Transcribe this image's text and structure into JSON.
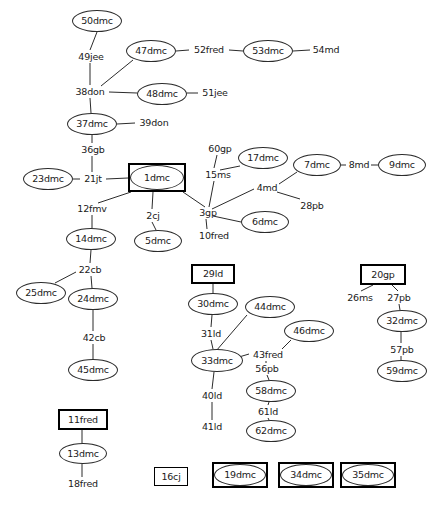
{
  "diagram": {
    "background_color": "#ffffff",
    "line_color": "#2b2b2b",
    "text_color": "#1a1a1a",
    "width": 435,
    "height": 507,
    "nodes": [
      {
        "id": "50dmc",
        "label": "50dmc",
        "shape": "ellipse",
        "x": 72,
        "y": 10,
        "w": 50,
        "h": 22
      },
      {
        "id": "49jee",
        "label": "49jee",
        "shape": "text",
        "x": 74,
        "y": 51,
        "w": 34,
        "h": 12
      },
      {
        "id": "47dmc",
        "label": "47dmc",
        "shape": "ellipse",
        "x": 126,
        "y": 40,
        "w": 50,
        "h": 22
      },
      {
        "id": "52fred",
        "label": "52fred",
        "shape": "text",
        "x": 190,
        "y": 44,
        "w": 38,
        "h": 12
      },
      {
        "id": "53dmc",
        "label": "53dmc",
        "shape": "ellipse",
        "x": 243,
        "y": 40,
        "w": 50,
        "h": 22
      },
      {
        "id": "54md",
        "label": "54md",
        "shape": "text",
        "x": 311,
        "y": 44,
        "w": 30,
        "h": 12
      },
      {
        "id": "38don",
        "label": "38don",
        "shape": "text",
        "x": 72,
        "y": 86,
        "w": 36,
        "h": 12
      },
      {
        "id": "48dmc",
        "label": "48dmc",
        "shape": "ellipse",
        "x": 137,
        "y": 83,
        "w": 50,
        "h": 22
      },
      {
        "id": "51jee",
        "label": "51jee",
        "shape": "text",
        "x": 199,
        "y": 87,
        "w": 32,
        "h": 12
      },
      {
        "id": "37dmc",
        "label": "37dmc",
        "shape": "ellipse",
        "x": 67,
        "y": 113,
        "w": 50,
        "h": 22
      },
      {
        "id": "39don",
        "label": "39don",
        "shape": "text",
        "x": 136,
        "y": 117,
        "w": 36,
        "h": 12
      },
      {
        "id": "36gb",
        "label": "36gb",
        "shape": "text",
        "x": 78,
        "y": 144,
        "w": 30,
        "h": 12
      },
      {
        "id": "23dmc",
        "label": "23dmc",
        "shape": "ellipse",
        "x": 23,
        "y": 168,
        "w": 50,
        "h": 22
      },
      {
        "id": "21jt",
        "label": "21jt",
        "shape": "text",
        "x": 80,
        "y": 173,
        "w": 26,
        "h": 12
      },
      {
        "id": "1dmc",
        "label": "1dmc",
        "shape": "boxed-ellipse",
        "x": 128,
        "y": 163,
        "w": 58,
        "h": 29
      },
      {
        "id": "60gp",
        "label": "60gp",
        "shape": "text",
        "x": 206,
        "y": 143,
        "w": 28,
        "h": 12
      },
      {
        "id": "17dmc",
        "label": "17dmc",
        "shape": "ellipse",
        "x": 238,
        "y": 147,
        "w": 50,
        "h": 22
      },
      {
        "id": "15ms",
        "label": "15ms",
        "shape": "text",
        "x": 204,
        "y": 169,
        "w": 28,
        "h": 12
      },
      {
        "id": "7dmc",
        "label": "7dmc",
        "shape": "ellipse",
        "x": 293,
        "y": 154,
        "w": 48,
        "h": 22
      },
      {
        "id": "8md",
        "label": "8md",
        "shape": "text",
        "x": 347,
        "y": 159,
        "w": 24,
        "h": 12
      },
      {
        "id": "9dmc",
        "label": "9dmc",
        "shape": "ellipse",
        "x": 378,
        "y": 154,
        "w": 48,
        "h": 22
      },
      {
        "id": "4md",
        "label": "4md",
        "shape": "text",
        "x": 255,
        "y": 182,
        "w": 24,
        "h": 12
      },
      {
        "id": "28pb",
        "label": "28pb",
        "shape": "text",
        "x": 298,
        "y": 200,
        "w": 28,
        "h": 12
      },
      {
        "id": "3gp",
        "label": "3gp",
        "shape": "text",
        "x": 197,
        "y": 207,
        "w": 22,
        "h": 12
      },
      {
        "id": "6dmc",
        "label": "6dmc",
        "shape": "ellipse",
        "x": 241,
        "y": 211,
        "w": 48,
        "h": 22
      },
      {
        "id": "10fred",
        "label": "10fred",
        "shape": "text",
        "x": 195,
        "y": 230,
        "w": 38,
        "h": 12
      },
      {
        "id": "2cj",
        "label": "2cj",
        "shape": "text",
        "x": 143,
        "y": 210,
        "w": 20,
        "h": 12
      },
      {
        "id": "5dmc",
        "label": "5dmc",
        "shape": "ellipse",
        "x": 134,
        "y": 230,
        "w": 48,
        "h": 22
      },
      {
        "id": "12fmv",
        "label": "12fmv",
        "shape": "text",
        "x": 75,
        "y": 203,
        "w": 34,
        "h": 12
      },
      {
        "id": "14dmc",
        "label": "14dmc",
        "shape": "ellipse",
        "x": 66,
        "y": 228,
        "w": 50,
        "h": 22
      },
      {
        "id": "22cb",
        "label": "22cb",
        "shape": "text",
        "x": 76,
        "y": 264,
        "w": 28,
        "h": 12
      },
      {
        "id": "25dmc",
        "label": "25dmc",
        "shape": "ellipse",
        "x": 16,
        "y": 282,
        "w": 50,
        "h": 22
      },
      {
        "id": "24dmc",
        "label": "24dmc",
        "shape": "ellipse",
        "x": 68,
        "y": 288,
        "w": 50,
        "h": 22
      },
      {
        "id": "42cb",
        "label": "42cb",
        "shape": "text",
        "x": 80,
        "y": 332,
        "w": 28,
        "h": 12
      },
      {
        "id": "45dmc",
        "label": "45dmc",
        "shape": "ellipse",
        "x": 68,
        "y": 359,
        "w": 50,
        "h": 22
      },
      {
        "id": "29ld",
        "label": "29ld",
        "shape": "rect",
        "x": 191,
        "y": 264,
        "w": 44,
        "h": 20
      },
      {
        "id": "30dmc",
        "label": "30dmc",
        "shape": "ellipse",
        "x": 188,
        "y": 293,
        "w": 50,
        "h": 22
      },
      {
        "id": "31ld",
        "label": "31ld",
        "shape": "text",
        "x": 199,
        "y": 328,
        "w": 24,
        "h": 12
      },
      {
        "id": "44dmc",
        "label": "44dmc",
        "shape": "ellipse",
        "x": 245,
        "y": 296,
        "w": 50,
        "h": 22
      },
      {
        "id": "46dmc",
        "label": "46dmc",
        "shape": "ellipse",
        "x": 284,
        "y": 320,
        "w": 50,
        "h": 22
      },
      {
        "id": "33dmc",
        "label": "33dmc",
        "shape": "ellipse",
        "x": 191,
        "y": 349,
        "w": 52,
        "h": 23
      },
      {
        "id": "43fred",
        "label": "43fred",
        "shape": "text",
        "x": 249,
        "y": 349,
        "w": 38,
        "h": 12
      },
      {
        "id": "56pb",
        "label": "56pb",
        "shape": "text",
        "x": 253,
        "y": 363,
        "w": 28,
        "h": 12
      },
      {
        "id": "58dmc",
        "label": "58dmc",
        "shape": "ellipse",
        "x": 246,
        "y": 380,
        "w": 50,
        "h": 22
      },
      {
        "id": "61ld",
        "label": "61ld",
        "shape": "text",
        "x": 256,
        "y": 406,
        "w": 24,
        "h": 12
      },
      {
        "id": "62dmc",
        "label": "62dmc",
        "shape": "ellipse",
        "x": 246,
        "y": 420,
        "w": 50,
        "h": 22
      },
      {
        "id": "40ld",
        "label": "40ld",
        "shape": "text",
        "x": 200,
        "y": 390,
        "w": 24,
        "h": 12
      },
      {
        "id": "41ld",
        "label": "41ld",
        "shape": "text",
        "x": 200,
        "y": 421,
        "w": 24,
        "h": 12
      },
      {
        "id": "20gp",
        "label": "20gp",
        "shape": "rect",
        "x": 360,
        "y": 264,
        "w": 46,
        "h": 21
      },
      {
        "id": "26ms",
        "label": "26ms",
        "shape": "text",
        "x": 345,
        "y": 292,
        "w": 30,
        "h": 12
      },
      {
        "id": "27pb",
        "label": "27pb",
        "shape": "text",
        "x": 385,
        "y": 292,
        "w": 28,
        "h": 12
      },
      {
        "id": "32dmc",
        "label": "32dmc",
        "shape": "ellipse",
        "x": 377,
        "y": 310,
        "w": 50,
        "h": 22
      },
      {
        "id": "57pb",
        "label": "57pb",
        "shape": "text",
        "x": 388,
        "y": 344,
        "w": 28,
        "h": 12
      },
      {
        "id": "59dmc",
        "label": "59dmc",
        "shape": "ellipse",
        "x": 377,
        "y": 360,
        "w": 50,
        "h": 22
      },
      {
        "id": "11fred",
        "label": "11fred",
        "shape": "rect",
        "x": 58,
        "y": 409,
        "w": 50,
        "h": 21
      },
      {
        "id": "13dmc",
        "label": "13dmc",
        "shape": "ellipse",
        "x": 59,
        "y": 443,
        "w": 48,
        "h": 21
      },
      {
        "id": "18fred",
        "label": "18fred",
        "shape": "text",
        "x": 64,
        "y": 478,
        "w": 38,
        "h": 12
      },
      {
        "id": "16cj",
        "label": "16cj",
        "shape": "rect-thin",
        "x": 154,
        "y": 467,
        "w": 34,
        "h": 19
      },
      {
        "id": "19dmc",
        "label": "19dmc",
        "shape": "boxed-ellipse",
        "x": 212,
        "y": 462,
        "w": 56,
        "h": 26
      },
      {
        "id": "34dmc",
        "label": "34dmc",
        "shape": "boxed-ellipse",
        "x": 278,
        "y": 462,
        "w": 56,
        "h": 26
      },
      {
        "id": "35dmc",
        "label": "35dmc",
        "shape": "boxed-ellipse",
        "x": 340,
        "y": 462,
        "w": 56,
        "h": 26
      }
    ],
    "edges": [
      {
        "from": "50dmc",
        "to": "49jee",
        "x1": 97,
        "y1": 32,
        "x2": 90,
        "y2": 50
      },
      {
        "from": "49jee",
        "to": "38don",
        "x1": 90,
        "y1": 63,
        "x2": 90,
        "y2": 85
      },
      {
        "from": "38don",
        "to": "47dmc",
        "x1": 101,
        "y1": 86,
        "x2": 133,
        "y2": 60
      },
      {
        "from": "47dmc",
        "to": "52fred",
        "x1": 176,
        "y1": 51,
        "x2": 189,
        "y2": 50
      },
      {
        "from": "52fred",
        "to": "53dmc",
        "x1": 229,
        "y1": 50,
        "x2": 243,
        "y2": 51
      },
      {
        "from": "53dmc",
        "to": "54md",
        "x1": 293,
        "y1": 51,
        "x2": 310,
        "y2": 50
      },
      {
        "from": "38don",
        "to": "48dmc",
        "x1": 109,
        "y1": 92,
        "x2": 137,
        "y2": 93
      },
      {
        "from": "48dmc",
        "to": "51jee",
        "x1": 187,
        "y1": 93,
        "x2": 198,
        "y2": 93
      },
      {
        "from": "38don",
        "to": "37dmc",
        "x1": 90,
        "y1": 98,
        "x2": 91,
        "y2": 113
      },
      {
        "from": "37dmc",
        "to": "39don",
        "x1": 117,
        "y1": 124,
        "x2": 135,
        "y2": 123
      },
      {
        "from": "37dmc",
        "to": "36gb",
        "x1": 92,
        "y1": 135,
        "x2": 92,
        "y2": 143
      },
      {
        "from": "36gb",
        "to": "21jt",
        "x1": 92,
        "y1": 156,
        "x2": 92,
        "y2": 172
      },
      {
        "from": "23dmc",
        "to": "21jt",
        "x1": 73,
        "y1": 179,
        "x2": 80,
        "y2": 179
      },
      {
        "from": "21jt",
        "to": "1dmc",
        "x1": 106,
        "y1": 179,
        "x2": 128,
        "y2": 178
      },
      {
        "from": "1dmc",
        "to": "12fmv",
        "x1": 131,
        "y1": 192,
        "x2": 98,
        "y2": 203
      },
      {
        "from": "1dmc",
        "to": "2cj",
        "x1": 153,
        "y1": 192,
        "x2": 152,
        "y2": 209
      },
      {
        "from": "2cj",
        "to": "5dmc",
        "x1": 152,
        "y1": 222,
        "x2": 156,
        "y2": 230
      },
      {
        "from": "1dmc",
        "to": "3gp",
        "x1": 183,
        "y1": 192,
        "x2": 205,
        "y2": 207
      },
      {
        "from": "60gp",
        "to": "15ms",
        "x1": 217,
        "y1": 155,
        "x2": 214,
        "y2": 168
      },
      {
        "from": "17dmc",
        "to": "15ms",
        "x1": 240,
        "y1": 166,
        "x2": 220,
        "y2": 170
      },
      {
        "from": "15ms",
        "to": "3gp",
        "x1": 214,
        "y1": 181,
        "x2": 209,
        "y2": 207
      },
      {
        "from": "3gp",
        "to": "4md",
        "x1": 212,
        "y1": 209,
        "x2": 254,
        "y2": 189
      },
      {
        "from": "4md",
        "to": "7dmc",
        "x1": 279,
        "y1": 184,
        "x2": 297,
        "y2": 172
      },
      {
        "from": "7dmc",
        "to": "8md",
        "x1": 341,
        "y1": 165,
        "x2": 346,
        "y2": 165
      },
      {
        "from": "8md",
        "to": "9dmc",
        "x1": 371,
        "y1": 165,
        "x2": 378,
        "y2": 165
      },
      {
        "from": "4md",
        "to": "28pb",
        "x1": 277,
        "y1": 192,
        "x2": 300,
        "y2": 199
      },
      {
        "from": "3gp",
        "to": "6dmc",
        "x1": 213,
        "y1": 216,
        "x2": 241,
        "y2": 222
      },
      {
        "from": "3gp",
        "to": "10fred",
        "x1": 206,
        "y1": 219,
        "x2": 207,
        "y2": 229
      },
      {
        "from": "12fmv",
        "to": "14dmc",
        "x1": 92,
        "y1": 215,
        "x2": 92,
        "y2": 228
      },
      {
        "from": "14dmc",
        "to": "22cb",
        "x1": 91,
        "y1": 250,
        "x2": 90,
        "y2": 263
      },
      {
        "from": "22cb",
        "to": "25dmc",
        "x1": 76,
        "y1": 272,
        "x2": 55,
        "y2": 283
      },
      {
        "from": "22cb",
        "to": "24dmc",
        "x1": 91,
        "y1": 276,
        "x2": 92,
        "y2": 288
      },
      {
        "from": "24dmc",
        "to": "42cb",
        "x1": 93,
        "y1": 310,
        "x2": 93,
        "y2": 331
      },
      {
        "from": "42cb",
        "to": "45dmc",
        "x1": 93,
        "y1": 344,
        "x2": 93,
        "y2": 359
      },
      {
        "from": "29ld",
        "to": "30dmc",
        "x1": 213,
        "y1": 284,
        "x2": 213,
        "y2": 293
      },
      {
        "from": "30dmc",
        "to": "31ld",
        "x1": 212,
        "y1": 315,
        "x2": 211,
        "y2": 327
      },
      {
        "from": "31ld",
        "to": "33dmc",
        "x1": 211,
        "y1": 340,
        "x2": 213,
        "y2": 349
      },
      {
        "from": "44dmc",
        "to": "33dmc",
        "x1": 247,
        "y1": 315,
        "x2": 216,
        "y2": 351
      },
      {
        "from": "33dmc",
        "to": "43fred",
        "x1": 239,
        "y1": 357,
        "x2": 249,
        "y2": 354
      },
      {
        "from": "43fred",
        "to": "46dmc",
        "x1": 282,
        "y1": 349,
        "x2": 291,
        "y2": 340
      },
      {
        "from": "43fred",
        "to": "56pb",
        "x1": 266,
        "y1": 361,
        "x2": 266,
        "y2": 363
      },
      {
        "from": "56pb",
        "to": "58dmc",
        "x1": 267,
        "y1": 375,
        "x2": 269,
        "y2": 380
      },
      {
        "from": "58dmc",
        "to": "61ld",
        "x1": 269,
        "y1": 402,
        "x2": 268,
        "y2": 405
      },
      {
        "from": "61ld",
        "to": "62dmc",
        "x1": 268,
        "y1": 418,
        "x2": 269,
        "y2": 420
      },
      {
        "from": "33dmc",
        "to": "40ld",
        "x1": 214,
        "y1": 372,
        "x2": 212,
        "y2": 389
      },
      {
        "from": "40ld",
        "to": "41ld",
        "x1": 212,
        "y1": 402,
        "x2": 212,
        "y2": 420
      },
      {
        "from": "20gp",
        "to": "26ms",
        "x1": 373,
        "y1": 285,
        "x2": 361,
        "y2": 291
      },
      {
        "from": "20gp",
        "to": "27pb",
        "x1": 392,
        "y1": 285,
        "x2": 398,
        "y2": 291
      },
      {
        "from": "27pb",
        "to": "32dmc",
        "x1": 399,
        "y1": 304,
        "x2": 400,
        "y2": 310
      },
      {
        "from": "32dmc",
        "to": "57pb",
        "x1": 401,
        "y1": 332,
        "x2": 401,
        "y2": 343
      },
      {
        "from": "57pb",
        "to": "59dmc",
        "x1": 401,
        "y1": 356,
        "x2": 401,
        "y2": 360
      },
      {
        "from": "11fred",
        "to": "13dmc",
        "x1": 82,
        "y1": 430,
        "x2": 82,
        "y2": 443
      },
      {
        "from": "13dmc",
        "to": "18fred",
        "x1": 82,
        "y1": 464,
        "x2": 82,
        "y2": 477
      }
    ]
  }
}
